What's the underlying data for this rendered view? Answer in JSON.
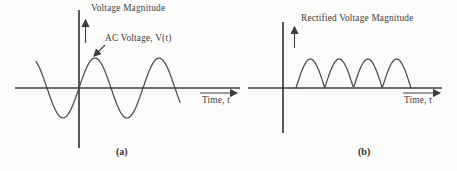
{
  "figure": {
    "background": "#fcfcfa",
    "ink_color": "#3d3d3d",
    "panels": [
      {
        "id": "a",
        "caption": "(a)",
        "y_axis_label": "Voltage Magnitude",
        "x_axis_label": "Time, t",
        "curve_label": "AC Voltage, V(t)",
        "waveform": {
          "type": "sine",
          "description": "AC sinusoidal voltage crossing zero at t=0, about 2.3 cycles shown, equal positive and negative swings",
          "x_start": 36,
          "x_end": 181,
          "origin_x": 79,
          "axis_y": 88,
          "amplitude": 30,
          "period_px": 64
        }
      },
      {
        "id": "b",
        "caption": "(b)",
        "y_axis_label": "Rectified Voltage Magnitude",
        "x_axis_label": "Time, t",
        "curve_label": "",
        "waveform": {
          "type": "rectified",
          "description": "Full-wave rectified voltage: four positive half-sine humps above the time axis",
          "humps": 4,
          "x_start": 296,
          "x_end": 411,
          "axis_y": 88,
          "amplitude": 29
        }
      }
    ]
  }
}
